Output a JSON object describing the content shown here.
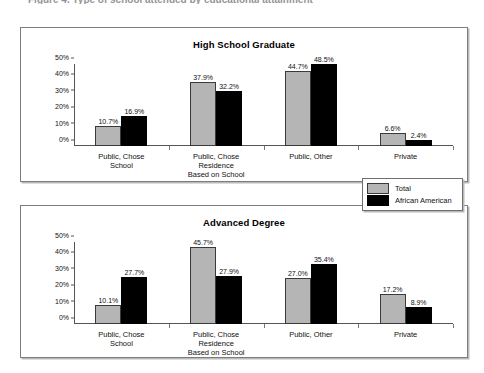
{
  "top_fragment": "Figure 4.  Type of school attended by educational attainment",
  "legend": {
    "entries": [
      {
        "label": "Total",
        "color": "#b5b5b5",
        "icon": "legend-swatch-gray"
      },
      {
        "label": "African American",
        "color": "#000000",
        "icon": "legend-swatch-black"
      }
    ]
  },
  "charts": [
    {
      "id": "high-school-graduate",
      "chart_data": {
        "type": "bar",
        "title": "High School Graduate",
        "xlabel": "",
        "ylabel": "",
        "ylim": [
          0,
          50
        ],
        "grid": false,
        "legend_position": "outside-right-between-panels",
        "yticks": [
          "0%",
          "10%",
          "20%",
          "30%",
          "40%",
          "50%"
        ],
        "ytick_values": [
          0,
          10,
          20,
          30,
          40,
          50
        ],
        "categories": [
          "Public, Chose\nSchool",
          "Public, Chose\nResidence\nBased on School",
          "Public, Other",
          "Private"
        ],
        "series": [
          {
            "name": "Total",
            "color": "#b5b5b5",
            "values": [
              10.7,
              37.9,
              44.7,
              6.6
            ],
            "labels": [
              "10.7%",
              "37.9%",
              "44.7%",
              "6.6%"
            ]
          },
          {
            "name": "African American",
            "color": "#000000",
            "values": [
              16.9,
              32.2,
              48.5,
              2.4
            ],
            "labels": [
              "16.9%",
              "32.2%",
              "48.5%",
              "2.4%"
            ]
          }
        ]
      }
    },
    {
      "id": "advanced-degree",
      "chart_data": {
        "type": "bar",
        "title": "Advanced Degree",
        "xlabel": "",
        "ylabel": "",
        "ylim": [
          0,
          50
        ],
        "grid": false,
        "legend_position": "outside-right-between-panels",
        "yticks": [
          "0%",
          "10%",
          "20%",
          "30%",
          "40%",
          "50%"
        ],
        "ytick_values": [
          0,
          10,
          20,
          30,
          40,
          50
        ],
        "categories": [
          "Public, Chose\nSchool",
          "Public, Chose\nResidence\nBased on School",
          "Public, Other",
          "Private"
        ],
        "series": [
          {
            "name": "Total",
            "color": "#b5b5b5",
            "values": [
              10.1,
              45.7,
              27.0,
              17.2
            ],
            "labels": [
              "10.1%",
              "45.7%",
              "27.0%",
              "17.2%"
            ]
          },
          {
            "name": "African American",
            "color": "#000000",
            "values": [
              27.7,
              27.9,
              35.4,
              8.9
            ],
            "labels": [
              "27.7%",
              "27.9%",
              "35.4%",
              "8.9%"
            ]
          }
        ]
      }
    }
  ]
}
